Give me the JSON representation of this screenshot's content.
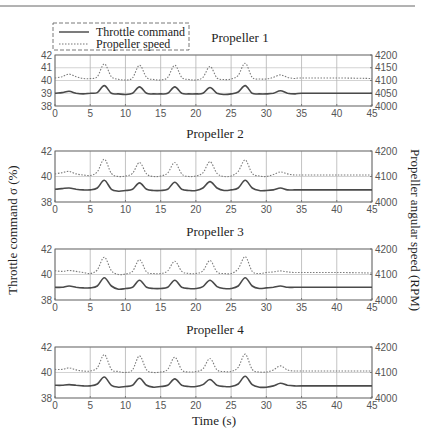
{
  "header": {
    "rule_color": "#555555"
  },
  "legend": {
    "items": [
      {
        "label": "Throttle command",
        "style": "solid",
        "color": "#555555"
      },
      {
        "label": "Propeller speed",
        "style": "dotted",
        "color": "#777777"
      }
    ]
  },
  "axes": {
    "xlabel": "Time (s)",
    "ylabel_left": "Throttle command σ (%)",
    "ylabel_right": "Propeller angular speed (RPM)"
  },
  "chart_data": [
    {
      "type": "line",
      "title": "Propeller 1",
      "xlabel": "Time (s)",
      "ylabel": "Throttle command σ (%)",
      "ylabel_right": "Propeller angular speed (RPM)",
      "xlim": [
        0,
        45
      ],
      "ylim": [
        38,
        42
      ],
      "ylim_right": [
        4000,
        4200
      ],
      "xticks": [
        0,
        5,
        10,
        15,
        20,
        25,
        30,
        35,
        40,
        45
      ],
      "yticks_left": [
        38,
        39,
        40,
        41,
        42
      ],
      "yticks_right": [
        4000,
        4050,
        4100,
        4150,
        4200
      ],
      "grid": true,
      "legend_position": "top-left, outside",
      "series": [
        {
          "name": "Throttle command",
          "axis": "left",
          "x": [
            0,
            1,
            2,
            3,
            4,
            5,
            6,
            7,
            8,
            9,
            10,
            11,
            12,
            13,
            14,
            15,
            16,
            17,
            18,
            19,
            20,
            21,
            22,
            23,
            24,
            25,
            26,
            27,
            28,
            29,
            30,
            31,
            32,
            33,
            34,
            35,
            40,
            45
          ],
          "values": [
            39.0,
            39.05,
            39.15,
            39.0,
            38.95,
            39.0,
            39.05,
            39.6,
            39.0,
            38.95,
            38.9,
            39.0,
            39.5,
            39.0,
            38.95,
            38.95,
            39.0,
            39.5,
            39.0,
            38.95,
            38.95,
            39.0,
            39.45,
            39.0,
            38.9,
            38.95,
            39.1,
            39.6,
            39.0,
            38.95,
            38.95,
            39.0,
            39.2,
            39.0,
            38.95,
            39.0,
            39.0,
            39.0
          ]
        },
        {
          "name": "Propeller speed",
          "axis": "right",
          "x": [
            0,
            1,
            2,
            3,
            4,
            5,
            6,
            7,
            8,
            9,
            10,
            11,
            12,
            13,
            14,
            15,
            16,
            17,
            18,
            19,
            20,
            21,
            22,
            23,
            24,
            25,
            26,
            27,
            28,
            29,
            30,
            31,
            32,
            33,
            34,
            35,
            40,
            45
          ],
          "values": [
            4110,
            4115,
            4125,
            4115,
            4108,
            4108,
            4115,
            4165,
            4115,
            4105,
            4102,
            4110,
            4160,
            4112,
            4104,
            4102,
            4112,
            4160,
            4112,
            4104,
            4102,
            4112,
            4155,
            4110,
            4104,
            4106,
            4120,
            4168,
            4112,
            4106,
            4106,
            4112,
            4122,
            4112,
            4108,
            4110,
            4110,
            4108
          ]
        }
      ]
    },
    {
      "type": "line",
      "title": "Propeller 2",
      "xlim": [
        0,
        45
      ],
      "ylim": [
        38,
        42
      ],
      "ylim_right": [
        4000,
        4200
      ],
      "xticks": [
        0,
        5,
        10,
        15,
        20,
        25,
        30,
        35,
        40,
        45
      ],
      "yticks_left": [
        38,
        40,
        42
      ],
      "yticks_right": [
        4000,
        4100,
        4200
      ],
      "grid": true,
      "series": [
        {
          "name": "Throttle command",
          "axis": "left",
          "x": [
            0,
            1,
            2,
            3,
            4,
            5,
            6,
            7,
            8,
            9,
            10,
            11,
            12,
            13,
            14,
            15,
            16,
            17,
            18,
            19,
            20,
            21,
            22,
            23,
            24,
            25,
            26,
            27,
            28,
            29,
            30,
            31,
            32,
            33,
            34,
            35,
            40,
            45
          ],
          "values": [
            39.0,
            39.05,
            39.1,
            39.0,
            38.95,
            38.95,
            39.1,
            39.7,
            39.0,
            38.85,
            38.9,
            39.0,
            39.5,
            39.0,
            38.9,
            38.9,
            39.0,
            39.55,
            39.0,
            38.9,
            38.9,
            39.1,
            39.6,
            39.1,
            38.9,
            38.95,
            39.1,
            39.7,
            39.1,
            38.9,
            38.9,
            38.95,
            39.1,
            38.95,
            38.95,
            38.95,
            38.95,
            38.95
          ]
        },
        {
          "name": "Propeller speed",
          "axis": "right",
          "x": [
            0,
            1,
            2,
            3,
            4,
            5,
            6,
            7,
            8,
            9,
            10,
            11,
            12,
            13,
            14,
            15,
            16,
            17,
            18,
            19,
            20,
            21,
            22,
            23,
            24,
            25,
            26,
            27,
            28,
            29,
            30,
            31,
            32,
            33,
            34,
            35,
            40,
            45
          ],
          "values": [
            4110,
            4115,
            4120,
            4110,
            4106,
            4104,
            4118,
            4168,
            4112,
            4100,
            4102,
            4112,
            4155,
            4110,
            4100,
            4102,
            4114,
            4155,
            4110,
            4100,
            4102,
            4114,
            4158,
            4112,
            4100,
            4102,
            4120,
            4165,
            4112,
            4102,
            4100,
            4108,
            4118,
            4110,
            4106,
            4106,
            4106,
            4106
          ]
        }
      ]
    },
    {
      "type": "line",
      "title": "Propeller 3",
      "xlim": [
        0,
        45
      ],
      "ylim": [
        38,
        42
      ],
      "ylim_right": [
        4000,
        4200
      ],
      "xticks": [
        0,
        5,
        10,
        15,
        20,
        25,
        30,
        35,
        40,
        45
      ],
      "yticks_left": [
        38,
        40,
        42
      ],
      "yticks_right": [
        4000,
        4100,
        4200
      ],
      "grid": true,
      "series": [
        {
          "name": "Throttle command",
          "axis": "left",
          "x": [
            0,
            1,
            2,
            3,
            4,
            5,
            6,
            7,
            8,
            9,
            10,
            11,
            12,
            13,
            14,
            15,
            16,
            17,
            18,
            19,
            20,
            21,
            22,
            23,
            24,
            25,
            26,
            27,
            28,
            29,
            30,
            31,
            32,
            33,
            34,
            35,
            40,
            45
          ],
          "values": [
            39.0,
            39.0,
            39.1,
            39.0,
            38.95,
            38.95,
            39.1,
            39.75,
            39.1,
            38.85,
            38.9,
            39.0,
            39.55,
            39.0,
            38.9,
            38.9,
            39.0,
            39.55,
            39.0,
            38.9,
            38.9,
            39.05,
            39.55,
            39.05,
            38.9,
            38.9,
            39.1,
            39.75,
            39.1,
            38.9,
            38.95,
            39.0,
            39.1,
            39.0,
            39.0,
            39.0,
            39.0,
            39.0
          ]
        },
        {
          "name": "Propeller speed",
          "axis": "right",
          "x": [
            0,
            1,
            2,
            3,
            4,
            5,
            6,
            7,
            8,
            9,
            10,
            11,
            12,
            13,
            14,
            15,
            16,
            17,
            18,
            19,
            20,
            21,
            22,
            23,
            24,
            25,
            26,
            27,
            28,
            29,
            30,
            31,
            32,
            33,
            34,
            35,
            40,
            45
          ],
          "values": [
            4115,
            4112,
            4116,
            4112,
            4108,
            4104,
            4118,
            4168,
            4115,
            4100,
            4102,
            4112,
            4158,
            4110,
            4104,
            4104,
            4114,
            4152,
            4112,
            4104,
            4104,
            4114,
            4155,
            4110,
            4104,
            4104,
            4122,
            4170,
            4112,
            4104,
            4108,
            4110,
            4114,
            4110,
            4108,
            4108,
            4108,
            4106
          ]
        }
      ]
    },
    {
      "type": "line",
      "title": "Propeller 4",
      "xlim": [
        0,
        45
      ],
      "ylim": [
        38,
        42
      ],
      "ylim_right": [
        4000,
        4200
      ],
      "xticks": [
        0,
        5,
        10,
        15,
        20,
        25,
        30,
        35,
        40,
        45
      ],
      "yticks_left": [
        38,
        40,
        42
      ],
      "yticks_right": [
        4000,
        4100,
        4200
      ],
      "grid": true,
      "series": [
        {
          "name": "Throttle command",
          "axis": "left",
          "x": [
            0,
            1,
            2,
            3,
            4,
            5,
            6,
            7,
            8,
            9,
            10,
            11,
            12,
            13,
            14,
            15,
            16,
            17,
            18,
            19,
            20,
            21,
            22,
            23,
            24,
            25,
            26,
            27,
            28,
            29,
            30,
            31,
            32,
            33,
            34,
            35,
            40,
            45
          ],
          "values": [
            39.0,
            39.0,
            39.05,
            39.0,
            38.95,
            38.95,
            39.1,
            39.65,
            39.0,
            38.85,
            38.9,
            39.0,
            39.55,
            39.0,
            38.85,
            38.9,
            39.0,
            39.5,
            39.0,
            38.9,
            38.9,
            39.05,
            39.45,
            39.0,
            38.9,
            38.9,
            39.1,
            39.7,
            39.05,
            38.85,
            38.85,
            38.95,
            39.15,
            39.0,
            38.95,
            38.95,
            38.95,
            38.95
          ]
        },
        {
          "name": "Propeller speed",
          "axis": "right",
          "x": [
            0,
            1,
            2,
            3,
            4,
            5,
            6,
            7,
            8,
            9,
            10,
            11,
            12,
            13,
            14,
            15,
            16,
            17,
            18,
            19,
            20,
            21,
            22,
            23,
            24,
            25,
            26,
            27,
            28,
            29,
            30,
            31,
            32,
            33,
            34,
            35,
            40,
            45
          ],
          "values": [
            4112,
            4112,
            4118,
            4110,
            4106,
            4106,
            4118,
            4170,
            4112,
            4104,
            4100,
            4110,
            4165,
            4110,
            4100,
            4102,
            4112,
            4160,
            4110,
            4102,
            4104,
            4114,
            4155,
            4110,
            4104,
            4104,
            4120,
            4172,
            4112,
            4102,
            4102,
            4110,
            4126,
            4110,
            4106,
            4106,
            4106,
            4106
          ]
        }
      ]
    }
  ]
}
